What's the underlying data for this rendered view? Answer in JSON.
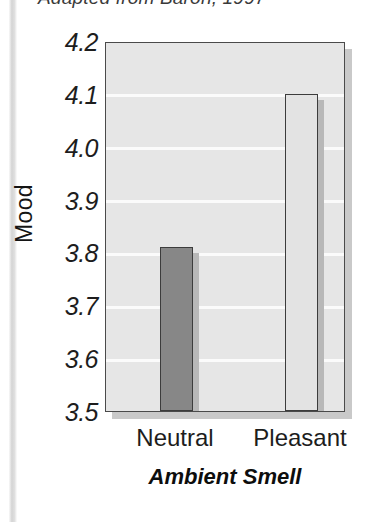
{
  "figure": {
    "caption": "Adapted from Baron, 1997"
  },
  "chart_data": {
    "type": "bar",
    "title": "",
    "subtitle": "",
    "categories": [
      "Neutral",
      "Pleasant"
    ],
    "values": [
      3.81,
      4.1
    ],
    "series": [
      {
        "name": "Mood",
        "values": [
          3.81,
          4.1
        ]
      }
    ],
    "xlabel": "Ambient Smell",
    "ylabel": "Mood",
    "ylim": [
      3.5,
      4.2
    ],
    "ytick_step": 0.1,
    "yticks": [
      "4.2",
      "4.1",
      "4.0",
      "3.9",
      "3.8",
      "3.7",
      "3.6",
      "3.5"
    ],
    "ytick_values": [
      4.2,
      4.1,
      4.0,
      3.9,
      3.8,
      3.7,
      3.6,
      3.5
    ],
    "grid": true,
    "grid_orientation": "horizontal",
    "legend": false,
    "legend_position": "none",
    "bar_colors": [
      "#878787",
      "#e3e3e3"
    ],
    "plot_background": "#e6e6e6",
    "gridline_color": "#fbfbfb",
    "axis_color": "#4a4a4a",
    "annotations": []
  }
}
